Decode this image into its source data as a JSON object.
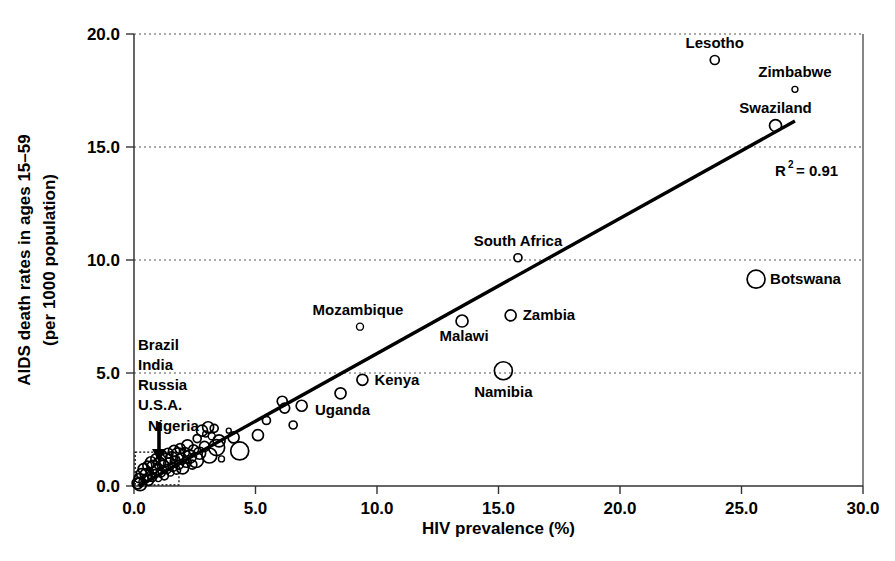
{
  "figure": {
    "background_color": "#ffffff",
    "ink_color": "#000000",
    "grid_color": "#555555",
    "caption_faint": ""
  },
  "axes": {
    "x_title": "HIV prevalence (%)",
    "y_title_line1": "AIDS death rates in ages 15–59",
    "y_title_line2": "(per 1000 population)",
    "x_ticks": [
      "0.0",
      "5.0",
      "10.0",
      "15.0",
      "20.0",
      "25.0",
      "30.0"
    ],
    "y_ticks": [
      "0.0",
      "5.0",
      "10.0",
      "15.0",
      "20.0"
    ]
  },
  "annotations": {
    "r2_base": "R",
    "r2_exponent": "2",
    "r2_value": "= 0.91",
    "callout_countries": [
      "Brazil",
      "India",
      "Russia",
      "U.S.A."
    ]
  },
  "chart_data": {
    "type": "scatter",
    "title": "",
    "xlabel": "HIV prevalence (%)",
    "ylabel": "AIDS death rates in ages 15–59 (per 1000 population)",
    "xlim": [
      0.0,
      30.0
    ],
    "ylim": [
      0.0,
      20.0
    ],
    "xticks": [
      0.0,
      5.0,
      10.0,
      15.0,
      20.0,
      25.0,
      30.0
    ],
    "yticks": [
      0.0,
      5.0,
      10.0,
      15.0,
      20.0
    ],
    "grid": "horizontal-dotted",
    "legend": "none",
    "annotation": "R2 = 0.91",
    "regression_line": {
      "x_start": 0.2,
      "y_start": 0.0,
      "x_end": 27.2,
      "y_end": 16.15
    },
    "highlight_box": {
      "x0": 0.05,
      "y0": 0.05,
      "x1": 1.85,
      "y1": 1.5,
      "label": "Brazil / India / Russia / U.S.A. cluster"
    },
    "labeled_points": [
      {
        "name": "Lesotho",
        "x": 23.9,
        "y": 18.85,
        "r": 4.5,
        "label_dx": 0,
        "label_dy": -12,
        "anchor": "middle"
      },
      {
        "name": "Zimbabwe",
        "x": 27.2,
        "y": 17.55,
        "r": 3.0,
        "label_dx": 0,
        "label_dy": -12,
        "anchor": "middle"
      },
      {
        "name": "Swaziland",
        "x": 26.4,
        "y": 15.95,
        "r": 6.0,
        "label_dx": 0,
        "label_dy": -13,
        "anchor": "middle"
      },
      {
        "name": "South Africa",
        "x": 15.8,
        "y": 10.1,
        "r": 4.0,
        "label_dx": 0,
        "label_dy": -12,
        "anchor": "middle"
      },
      {
        "name": "Botswana",
        "x": 25.6,
        "y": 9.15,
        "r": 9.0,
        "label_dx": 14,
        "label_dy": 5,
        "anchor": "start"
      },
      {
        "name": "Zambia",
        "x": 15.5,
        "y": 7.55,
        "r": 5.5,
        "label_dx": 12,
        "label_dy": 5,
        "anchor": "start"
      },
      {
        "name": "Malawi",
        "x": 13.5,
        "y": 7.3,
        "r": 6.0,
        "label_dx": 2,
        "label_dy": 20,
        "anchor": "middle"
      },
      {
        "name": "Mozambique",
        "x": 9.3,
        "y": 7.05,
        "r": 3.5,
        "label_dx": -2,
        "label_dy": -12,
        "anchor": "middle"
      },
      {
        "name": "Namibia",
        "x": 15.2,
        "y": 5.1,
        "r": 9.0,
        "label_dx": 0,
        "label_dy": 26,
        "anchor": "middle"
      },
      {
        "name": "Kenya",
        "x": 9.4,
        "y": 4.7,
        "r": 5.5,
        "label_dx": 12,
        "label_dy": 5,
        "anchor": "start"
      },
      {
        "name": "Uganda",
        "x": 8.5,
        "y": 4.1,
        "r": 5.5,
        "label_dx": 2,
        "label_dy": 22,
        "anchor": "middle"
      },
      {
        "name": "Nigeria",
        "x": 3.9,
        "y": 2.45,
        "r": 2.5,
        "label_dx": -30,
        "label_dy": 0,
        "anchor": "end"
      }
    ],
    "unlabeled_points": [
      {
        "x": 0.15,
        "y": 0.12,
        "r": 5.5
      },
      {
        "x": 0.2,
        "y": 0.35,
        "r": 4.5
      },
      {
        "x": 0.25,
        "y": 0.08,
        "r": 6.5
      },
      {
        "x": 0.3,
        "y": 0.55,
        "r": 5.0
      },
      {
        "x": 0.35,
        "y": 0.2,
        "r": 3.5
      },
      {
        "x": 0.4,
        "y": 0.75,
        "r": 5.5
      },
      {
        "x": 0.45,
        "y": 0.3,
        "r": 4.0
      },
      {
        "x": 0.5,
        "y": 0.5,
        "r": 6.0
      },
      {
        "x": 0.55,
        "y": 0.9,
        "r": 4.5
      },
      {
        "x": 0.6,
        "y": 0.25,
        "r": 5.0
      },
      {
        "x": 0.65,
        "y": 0.65,
        "r": 3.5
      },
      {
        "x": 0.7,
        "y": 1.05,
        "r": 5.5
      },
      {
        "x": 0.75,
        "y": 0.4,
        "r": 4.5
      },
      {
        "x": 0.8,
        "y": 0.85,
        "r": 6.5
      },
      {
        "x": 0.85,
        "y": 0.55,
        "r": 4.0
      },
      {
        "x": 0.9,
        "y": 1.2,
        "r": 5.0
      },
      {
        "x": 0.95,
        "y": 0.7,
        "r": 5.5
      },
      {
        "x": 1.0,
        "y": 0.35,
        "r": 3.5
      },
      {
        "x": 1.05,
        "y": 1.0,
        "r": 6.0
      },
      {
        "x": 1.1,
        "y": 0.6,
        "r": 4.5
      },
      {
        "x": 1.15,
        "y": 1.35,
        "r": 5.0
      },
      {
        "x": 1.2,
        "y": 0.9,
        "r": 5.5
      },
      {
        "x": 1.25,
        "y": 0.45,
        "r": 4.0
      },
      {
        "x": 1.3,
        "y": 1.15,
        "r": 6.5
      },
      {
        "x": 1.35,
        "y": 0.75,
        "r": 4.5
      },
      {
        "x": 1.4,
        "y": 1.45,
        "r": 5.0
      },
      {
        "x": 1.45,
        "y": 1.0,
        "r": 5.5
      },
      {
        "x": 1.5,
        "y": 0.6,
        "r": 3.5
      },
      {
        "x": 1.55,
        "y": 1.25,
        "r": 6.0
      },
      {
        "x": 1.6,
        "y": 0.85,
        "r": 4.5
      },
      {
        "x": 1.65,
        "y": 1.55,
        "r": 5.5
      },
      {
        "x": 1.7,
        "y": 1.1,
        "r": 5.0
      },
      {
        "x": 1.75,
        "y": 0.7,
        "r": 4.0
      },
      {
        "x": 1.8,
        "y": 1.4,
        "r": 6.5
      },
      {
        "x": 1.85,
        "y": 0.95,
        "r": 4.5
      },
      {
        "x": 1.9,
        "y": 1.65,
        "r": 5.0
      },
      {
        "x": 1.95,
        "y": 1.2,
        "r": 5.5
      },
      {
        "x": 2.0,
        "y": 0.8,
        "r": 6.0
      },
      {
        "x": 2.1,
        "y": 1.5,
        "r": 4.5
      },
      {
        "x": 2.15,
        "y": 1.05,
        "r": 5.0
      },
      {
        "x": 2.2,
        "y": 1.8,
        "r": 5.5
      },
      {
        "x": 2.3,
        "y": 1.3,
        "r": 6.5
      },
      {
        "x": 2.4,
        "y": 0.95,
        "r": 4.5
      },
      {
        "x": 2.45,
        "y": 1.6,
        "r": 5.0
      },
      {
        "x": 2.55,
        "y": 1.15,
        "r": 7.5
      },
      {
        "x": 2.6,
        "y": 2.1,
        "r": 4.0
      },
      {
        "x": 2.7,
        "y": 1.45,
        "r": 6.0
      },
      {
        "x": 2.8,
        "y": 2.45,
        "r": 5.5
      },
      {
        "x": 2.9,
        "y": 1.75,
        "r": 5.0
      },
      {
        "x": 2.95,
        "y": 2.3,
        "r": 3.0
      },
      {
        "x": 3.05,
        "y": 2.6,
        "r": 5.5
      },
      {
        "x": 3.1,
        "y": 1.35,
        "r": 7.5
      },
      {
        "x": 3.2,
        "y": 2.2,
        "r": 3.5
      },
      {
        "x": 3.3,
        "y": 2.55,
        "r": 4.0
      },
      {
        "x": 3.4,
        "y": 1.7,
        "r": 8.0
      },
      {
        "x": 3.5,
        "y": 2.0,
        "r": 6.0
      },
      {
        "x": 3.6,
        "y": 1.2,
        "r": 3.0
      },
      {
        "x": 4.1,
        "y": 2.15,
        "r": 5.5
      },
      {
        "x": 4.35,
        "y": 1.55,
        "r": 9.0
      },
      {
        "x": 5.1,
        "y": 2.25,
        "r": 5.5
      },
      {
        "x": 5.45,
        "y": 2.9,
        "r": 4.0
      },
      {
        "x": 6.1,
        "y": 3.75,
        "r": 5.0
      },
      {
        "x": 6.2,
        "y": 3.45,
        "r": 5.0
      },
      {
        "x": 6.55,
        "y": 2.7,
        "r": 4.0
      },
      {
        "x": 6.9,
        "y": 3.55,
        "r": 5.5
      }
    ]
  }
}
